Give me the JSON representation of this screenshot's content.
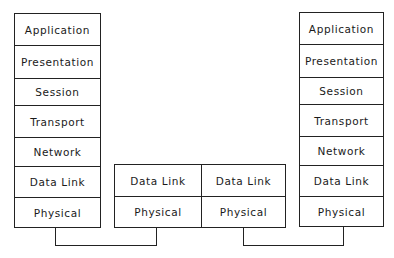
{
  "diagram": {
    "type": "OSI model network path",
    "left_host": {
      "layers": [
        "Application",
        "Presentation",
        "Session",
        "Transport",
        "Network",
        "Data Link",
        "Physical"
      ]
    },
    "right_host": {
      "layers": [
        "Application",
        "Presentation",
        "Session",
        "Transport",
        "Network",
        "Data Link",
        "Physical"
      ]
    },
    "intermediate": {
      "left_unit": {
        "layers": [
          "Data Link",
          "Physical"
        ]
      },
      "right_unit": {
        "layers": [
          "Data Link",
          "Physical"
        ]
      }
    },
    "colors": {
      "line": "#222222",
      "background": "#ffffff",
      "text": "#1a1a1a"
    }
  }
}
